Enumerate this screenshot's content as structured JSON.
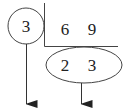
{
  "diagram": {
    "type": "short-division",
    "divisor": "3",
    "dividends": [
      "6",
      "9"
    ],
    "quotients": [
      "2",
      "3"
    ],
    "colors": {
      "stroke": "#333333",
      "text": "#222222",
      "background": "#ffffff"
    }
  }
}
